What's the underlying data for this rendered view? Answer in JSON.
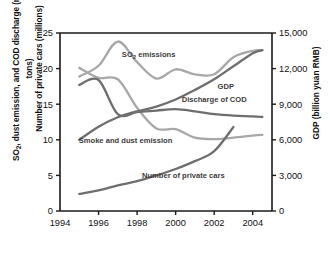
{
  "axes": {
    "left_label_line1": "SO2, dust emission, and COD discharge (million tons)",
    "left_label_line2": "Number of private cars (millions)",
    "right_label": "GDP (billion yuan RMB)",
    "left_ticks": [
      "0",
      "5",
      "10",
      "15",
      "20",
      "25"
    ],
    "right_ticks": [
      "0",
      "3,000",
      "6,000",
      "9,000",
      "12,000",
      "15,000"
    ],
    "x_ticks": [
      "1994",
      "1996",
      "1998",
      "2000",
      "2002",
      "2004"
    ]
  },
  "colors": {
    "axis": "#1a1a1a",
    "light_gray_series": "#a8a8a8",
    "dark_gray_series": "#6e6e6e",
    "text": "#111111"
  },
  "series_labels": {
    "so2": "SO2 emissions",
    "gdp": "GDP",
    "cod": "Discharge of COD",
    "smoke": "Smoke and dust emission",
    "cars": "Number of private cars"
  },
  "chart_data": {
    "type": "line",
    "title": "",
    "xlabel": "",
    "ylabel": "SO2, dust emission, and COD discharge (million tons) / Number of private cars (millions)",
    "ylabel_right": "GDP (billion yuan RMB)",
    "xlim": [
      1994,
      2005
    ],
    "ylim": [
      0,
      25
    ],
    "ylim_right": [
      0,
      15000
    ],
    "grid": false,
    "legend": "inline-labels",
    "x": [
      1995,
      1996,
      1997,
      1998,
      1999,
      2000,
      2001,
      2002,
      2003,
      2004,
      2004.5
    ],
    "series": [
      {
        "name": "SO2 emissions",
        "axis": "left",
        "units": "million tons",
        "color": "#a8a8a8",
        "values": [
          18.9,
          20.4,
          23.8,
          20.9,
          18.6,
          19.9,
          19.2,
          19.2,
          21.6,
          22.5,
          22.6
        ]
      },
      {
        "name": "Smoke and dust emission",
        "axis": "left",
        "units": "million tons",
        "color": "#a8a8a8",
        "values": [
          20.1,
          18.7,
          18.5,
          14.5,
          11.6,
          11.5,
          10.3,
          10.1,
          10.3,
          10.6,
          10.7
        ]
      },
      {
        "name": "Discharge of COD",
        "axis": "left",
        "units": "million tons",
        "color": "#6e6e6e",
        "values": [
          17.7,
          18.4,
          13.6,
          13.9,
          14.1,
          14.3,
          14.0,
          13.6,
          13.4,
          13.3,
          13.2
        ]
      },
      {
        "name": "GDP",
        "axis": "right",
        "units": "billion yuan RMB",
        "color": "#6e6e6e",
        "values": [
          6000,
          7100,
          7900,
          8400,
          8800,
          9400,
          10200,
          11100,
          12200,
          13300,
          13550
        ]
      },
      {
        "name": "Number of private cars",
        "axis": "left",
        "units": "millions",
        "color": "#6e6e6e",
        "values": [
          2.4,
          2.9,
          3.6,
          4.2,
          5.0,
          5.9,
          7.0,
          8.4,
          11.8,
          null,
          null
        ]
      }
    ],
    "annotations": [
      {
        "text": "SO2 emissions",
        "x": 1998.6,
        "y": 21.6
      },
      {
        "text": "GDP",
        "x": 2002.6,
        "y": 17.2
      },
      {
        "text": "Discharge of COD",
        "x": 2002.0,
        "y": 15.3
      },
      {
        "text": "Smoke and dust emission",
        "x": 1997.4,
        "y": 9.6
      },
      {
        "text": "Number of private cars",
        "x": 2000.4,
        "y": 4.6
      }
    ]
  }
}
